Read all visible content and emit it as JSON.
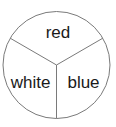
{
  "diagram": {
    "type": "circle-divided-into-three-sectors",
    "stroke_color": "#7a7a7a",
    "text_color": "#1a1a1a",
    "background": "#ffffff",
    "sectors": [
      {
        "label": "red",
        "position": "top"
      },
      {
        "label": "white",
        "position": "bottom-left"
      },
      {
        "label": "blue",
        "position": "bottom-right"
      }
    ]
  }
}
